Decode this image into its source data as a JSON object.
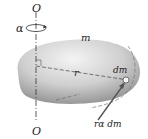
{
  "diagram": {
    "labels": {
      "axis_top": "O",
      "axis_bottom": "O",
      "angular_accel": "α",
      "mass": "m",
      "radius": "r",
      "mass_element": "dm",
      "tangential_force": "rα dm"
    },
    "colors": {
      "body_light": "#f2f2f2",
      "body_dark": "#8a8a8a",
      "line": "#333333",
      "arrow": "#555555"
    }
  }
}
